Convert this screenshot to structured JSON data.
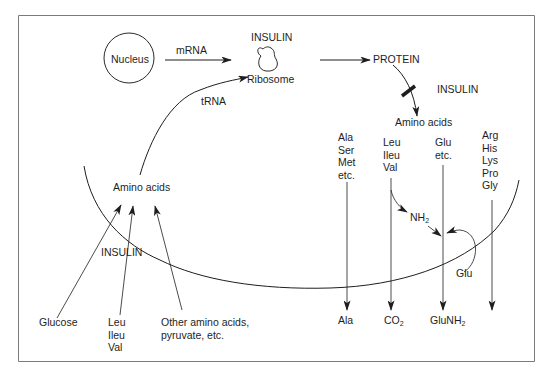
{
  "diagram": {
    "nodes": {
      "nucleus": "Nucleus",
      "mrna": "mRNA",
      "insulin_top": "INSULIN",
      "ribosome": "Ribosome",
      "protein": "PROTEIN",
      "insulin_right": "INSULIN",
      "amino_acids_right": "Amino acids",
      "trna": "tRNA",
      "amino_acids_left": "Amino acids",
      "insulin_left": "INSULIN",
      "glucose": "Glucose",
      "other_amino_acids_line1": "Other amino acids,",
      "other_amino_acids_line2": "pyruvate, etc.",
      "nh2": "NH",
      "nh2_sub": "2",
      "glu_donor": "Glu"
    },
    "amino_acid_groups": {
      "group1": [
        "Ala",
        "Ser",
        "Met",
        "etc."
      ],
      "group2": [
        "Leu",
        "Ileu",
        "Val"
      ],
      "group3": [
        "Glu",
        "etc."
      ],
      "group4": [
        "Arg",
        "His",
        "Lys",
        "Pro",
        "Gly"
      ],
      "uptake_bcaa": [
        "Leu",
        "Ileu",
        "Val"
      ]
    },
    "outputs": {
      "ala": "Ala",
      "co2": "CO",
      "co2_sub": "2",
      "glunh2": "GluNH",
      "glunh2_sub": "2"
    },
    "colors": {
      "line": "#1e1e1e",
      "frame": "#777777",
      "background": "#ffffff"
    }
  }
}
